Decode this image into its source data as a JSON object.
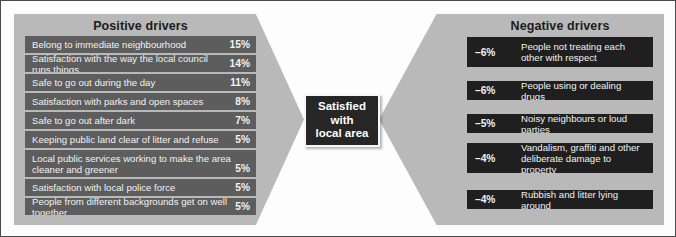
{
  "chart_data": {
    "type": "bar",
    "title": "Satisfied with local area",
    "xlabel": "",
    "ylabel": "",
    "series": [
      {
        "name": "Positive drivers",
        "categories": [
          "Belong to immediate neighbourhood",
          "Satisfaction with the way the local council runs things",
          "Safe to go out during the day",
          "Satisfaction with parks and open spaces",
          "Safe to go out after dark",
          "Keeping public land clear of litter and refuse",
          "Local public services working to make the area cleaner and greener",
          "Satisfaction with local police force",
          "People from different backgrounds get on well together"
        ],
        "values": [
          15,
          14,
          11,
          8,
          7,
          5,
          5,
          5,
          5
        ],
        "value_labels": [
          "15%",
          "14%",
          "11%",
          "8%",
          "7%",
          "5%",
          "5%",
          "5%",
          "5%"
        ]
      },
      {
        "name": "Negative drivers",
        "categories": [
          "People not treating each other with respect",
          "People using or dealing drugs",
          "Noisy neighbours or loud parties",
          "Vandalism, graffiti and other deliberate damage to property",
          "Rubbish and litter lying around"
        ],
        "values": [
          -6,
          -6,
          -5,
          -4,
          -4
        ],
        "value_labels": [
          "–6%",
          "–6%",
          "–5%",
          "–4%",
          "–4%"
        ]
      }
    ],
    "legend_position": "none",
    "grid": false
  },
  "center": {
    "line1": "Satisfied",
    "line2": "with",
    "line3": "local area"
  },
  "positive": {
    "header": "Positive drivers",
    "rows": [
      {
        "label": "Belong to immediate neighbourhood",
        "value": "15%"
      },
      {
        "label": "Satisfaction with the way the local council runs things",
        "value": "14%"
      },
      {
        "label": "Safe to go out during the day",
        "value": "11%"
      },
      {
        "label": "Satisfaction with parks and open spaces",
        "value": "8%"
      },
      {
        "label": "Safe to go out after dark",
        "value": "7%"
      },
      {
        "label": "Keeping public land clear of litter and refuse",
        "value": "5%"
      },
      {
        "label": "Local public services working to make the area cleaner and greener",
        "value": "5%"
      },
      {
        "label": "Satisfaction with local police force",
        "value": "5%"
      },
      {
        "label": "People from different backgrounds get on well together",
        "value": "5%"
      }
    ]
  },
  "negative": {
    "header": "Negative drivers",
    "rows": [
      {
        "value": "–6%",
        "label": "People not treating each other with respect"
      },
      {
        "value": "–6%",
        "label": "People using or dealing drugs"
      },
      {
        "value": "–5%",
        "label": "Noisy neighbours or loud parties"
      },
      {
        "value": "–4%",
        "label": "Vandalism, graffiti and other deliberate damage to property"
      },
      {
        "value": "–4%",
        "label": "Rubbish and litter lying around"
      }
    ]
  },
  "colors": {
    "panel": "#b9b9b9",
    "positive_bar": "#5d5d5d",
    "negative_bar": "#1f1f1f",
    "center_box": "#262626",
    "background": "#fdfdfd",
    "text_light": "#f2f2f2",
    "text_dark": "#1c1c1c"
  }
}
